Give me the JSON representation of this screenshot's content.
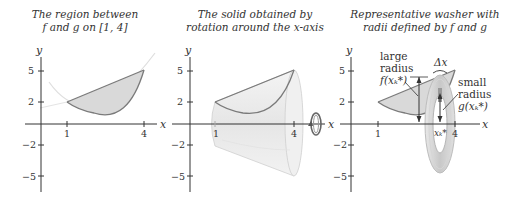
{
  "panels": [
    {
      "caption_line1": "The region between",
      "caption_line2": "f and g on [1, 4]",
      "x_axis_label": "x",
      "y_axis_label": "y",
      "x_ticks": [
        "1",
        "4"
      ],
      "y_ticks": [
        "5",
        "2",
        "−2",
        "−5"
      ]
    },
    {
      "caption_line1": "The solid obtained by",
      "caption_line2": "rotation around the x-axis",
      "x_axis_label": "x",
      "y_axis_label": "y",
      "x_ticks": [
        "1",
        "4"
      ],
      "y_ticks": [
        "5",
        "2",
        "−2",
        "−5"
      ]
    },
    {
      "caption_line1": "Representative washer with",
      "caption_line2": "radii defined by f and g",
      "x_axis_label": "x",
      "y_axis_label": "y",
      "x_ticks": [
        "1",
        "4"
      ],
      "y_ticks": [
        "5",
        "2",
        "−2",
        "−5"
      ],
      "annotations": {
        "large_radius_line1": "large",
        "large_radius_line2": "radius",
        "large_radius_expr": "f(xₖ*)",
        "small_radius_line1": "small",
        "small_radius_line2": "radius",
        "small_radius_expr": "g(xₖ*)",
        "delta_x": "Δx",
        "xk_star": "xₖ*"
      }
    }
  ],
  "colors": {
    "axis": "#333333",
    "curve": "#7a7a7a",
    "region_fill": "#d9d9d9",
    "faint_curve": "#dcdcdc",
    "solid_fill": "#ececec"
  }
}
